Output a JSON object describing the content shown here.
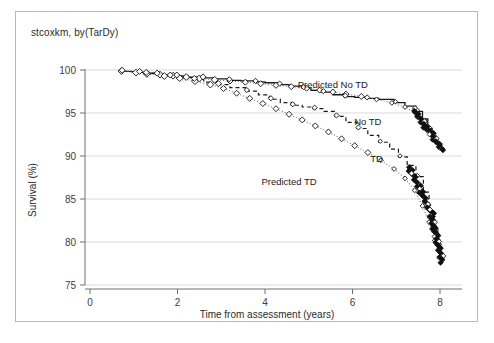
{
  "figure": {
    "title": "stcoxkm, by(TarDy)",
    "frame_color": "#b8b8b8",
    "background": "#ffffff"
  },
  "chart_data": {
    "type": "line",
    "title": "stcoxkm, by(TarDy)",
    "xlabel": "Time from assessment (years)",
    "ylabel": "Survival (%)",
    "xlim": [
      0,
      8.4
    ],
    "ylim": [
      75,
      100
    ],
    "xticks": [
      0,
      2,
      4,
      6,
      8
    ],
    "xtick_labels": [
      "0",
      "2",
      "4",
      "6",
      "8"
    ],
    "yticks": [
      75,
      80,
      85,
      90,
      95,
      100
    ],
    "ytick_labels": [
      "75",
      "80",
      "85",
      "90",
      "95",
      "100"
    ],
    "grid": "horizontal",
    "grid_color": "#d9d9d9",
    "legend_position": "inline-annotations",
    "annotations": [
      {
        "text": "Predicted No TD",
        "x": 5.55,
        "y": 97.9
      },
      {
        "text": "No TD",
        "x": 6.35,
        "y": 93.6
      },
      {
        "text": "TD",
        "x": 6.55,
        "y": 89.3
      },
      {
        "text": "Predicted TD",
        "x": 4.55,
        "y": 86.6
      }
    ],
    "series": [
      {
        "name": "No TD",
        "style": "solid-step",
        "color": "#1a1a1a",
        "marker": "none",
        "points": [
          [
            0.7,
            99.85
          ],
          [
            0.95,
            99.8
          ],
          [
            1.1,
            99.72
          ],
          [
            1.35,
            99.62
          ],
          [
            1.5,
            99.52
          ],
          [
            1.7,
            99.4
          ],
          [
            1.95,
            99.3
          ],
          [
            2.25,
            99.18
          ],
          [
            2.55,
            99.08
          ],
          [
            2.85,
            98.96
          ],
          [
            3.15,
            98.8
          ],
          [
            3.45,
            98.74
          ],
          [
            3.75,
            98.62
          ],
          [
            4.0,
            98.52
          ],
          [
            4.3,
            98.3
          ],
          [
            4.55,
            98.12
          ],
          [
            4.85,
            97.9
          ],
          [
            5.05,
            97.62
          ],
          [
            5.3,
            97.42
          ],
          [
            5.55,
            97.12
          ],
          [
            5.8,
            96.9
          ],
          [
            6.05,
            96.82
          ],
          [
            6.3,
            96.7
          ],
          [
            6.6,
            96.58
          ],
          [
            6.95,
            96.2
          ],
          [
            7.2,
            95.8
          ],
          [
            7.45,
            95.2
          ],
          [
            7.6,
            94.3
          ],
          [
            7.72,
            93.2
          ],
          [
            7.82,
            92.3
          ],
          [
            7.92,
            91.4
          ],
          [
            8.0,
            90.8
          ]
        ]
      },
      {
        "name": "Predicted No TD",
        "style": "dotted",
        "color": "#7a7a7a",
        "marker": "diamond-open",
        "points": [
          [
            0.72,
            99.88
          ],
          [
            1.05,
            99.7
          ],
          [
            1.3,
            99.58
          ],
          [
            1.6,
            99.46
          ],
          [
            1.9,
            99.34
          ],
          [
            2.2,
            99.18
          ],
          [
            2.5,
            99.02
          ],
          [
            2.85,
            98.86
          ],
          [
            3.2,
            98.72
          ],
          [
            3.55,
            98.58
          ],
          [
            3.9,
            98.4
          ],
          [
            4.25,
            98.22
          ],
          [
            4.6,
            98.06
          ],
          [
            4.95,
            97.88
          ],
          [
            5.25,
            97.66
          ],
          [
            5.55,
            97.44
          ],
          [
            5.85,
            97.2
          ],
          [
            6.2,
            96.92
          ],
          [
            6.55,
            96.58
          ],
          [
            6.9,
            96.18
          ],
          [
            7.2,
            95.7
          ],
          [
            7.45,
            95.0
          ],
          [
            7.65,
            94.0
          ],
          [
            7.8,
            92.9
          ],
          [
            7.9,
            91.9
          ],
          [
            8.0,
            91.0
          ]
        ]
      },
      {
        "name": "TD",
        "style": "dashed-step",
        "color": "#1a1a1a",
        "marker": "none",
        "points": [
          [
            1.25,
            99.6
          ],
          [
            1.55,
            99.4
          ],
          [
            1.8,
            99.3
          ],
          [
            2.1,
            99.12
          ],
          [
            2.35,
            98.9
          ],
          [
            2.6,
            98.6
          ],
          [
            2.9,
            98.3
          ],
          [
            3.2,
            97.95
          ],
          [
            3.55,
            97.55
          ],
          [
            3.85,
            97.1
          ],
          [
            4.1,
            96.6
          ],
          [
            4.35,
            96.2
          ],
          [
            4.6,
            95.9
          ],
          [
            4.85,
            95.7
          ],
          [
            5.1,
            95.5
          ],
          [
            5.35,
            95.2
          ],
          [
            5.6,
            94.6
          ],
          [
            5.85,
            93.9
          ],
          [
            6.1,
            93.2
          ],
          [
            6.35,
            92.4
          ],
          [
            6.6,
            91.6
          ],
          [
            6.85,
            90.8
          ],
          [
            7.05,
            89.9
          ],
          [
            7.25,
            88.9
          ],
          [
            7.45,
            87.6
          ],
          [
            7.62,
            85.8
          ],
          [
            7.75,
            83.5
          ],
          [
            7.85,
            81.8
          ],
          [
            7.95,
            79.6
          ],
          [
            8.02,
            78.0
          ]
        ]
      },
      {
        "name": "Predicted TD",
        "style": "dotted",
        "color": "#7a7a7a",
        "marker": "diamond-open",
        "points": [
          [
            1.3,
            99.55
          ],
          [
            1.7,
            99.3
          ],
          [
            2.05,
            99.05
          ],
          [
            2.4,
            98.7
          ],
          [
            2.75,
            98.3
          ],
          [
            3.05,
            97.85
          ],
          [
            3.35,
            97.3
          ],
          [
            3.65,
            96.7
          ],
          [
            3.95,
            96.1
          ],
          [
            4.25,
            95.5
          ],
          [
            4.55,
            94.85
          ],
          [
            4.85,
            94.2
          ],
          [
            5.15,
            93.5
          ],
          [
            5.45,
            92.8
          ],
          [
            5.75,
            92.0
          ],
          [
            6.05,
            91.2
          ],
          [
            6.35,
            90.4
          ],
          [
            6.65,
            89.5
          ],
          [
            6.95,
            88.5
          ],
          [
            7.2,
            87.4
          ],
          [
            7.42,
            86.0
          ],
          [
            7.6,
            84.2
          ],
          [
            7.75,
            82.3
          ],
          [
            7.88,
            80.2
          ],
          [
            7.98,
            78.2
          ]
        ]
      }
    ],
    "marker_clusters": [
      {
        "name": "no-td-dense-cluster",
        "x_range": [
          7.4,
          8.05
        ],
        "y_range": [
          90.7,
          95.4
        ],
        "note": "dense overlapping open/filled diamonds"
      },
      {
        "name": "td-dense-cluster",
        "x_range": [
          7.3,
          7.85
        ],
        "y_range": [
          83.0,
          88.6
        ],
        "note": "dense overlapping diamonds"
      },
      {
        "name": "td-tail-markers",
        "x_range": [
          7.8,
          8.05
        ],
        "y_range": [
          77.8,
          83.0
        ],
        "note": "isolated diamonds along tail"
      }
    ]
  }
}
